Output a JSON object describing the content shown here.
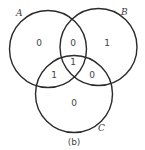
{
  "diagram": {
    "type": "venn-3",
    "caption": "(b)",
    "sets": [
      {
        "id": "A",
        "label": "A"
      },
      {
        "id": "B",
        "label": "B"
      },
      {
        "id": "C",
        "label": "C"
      }
    ],
    "regions": {
      "A_only": "0",
      "B_only": "1",
      "C_only": "0",
      "A_and_B": "0",
      "A_and_C": "1",
      "B_and_C": "0",
      "A_and_B_and_C": "1"
    },
    "stroke_color": "#2a2a2a",
    "text_color": "#444444"
  }
}
